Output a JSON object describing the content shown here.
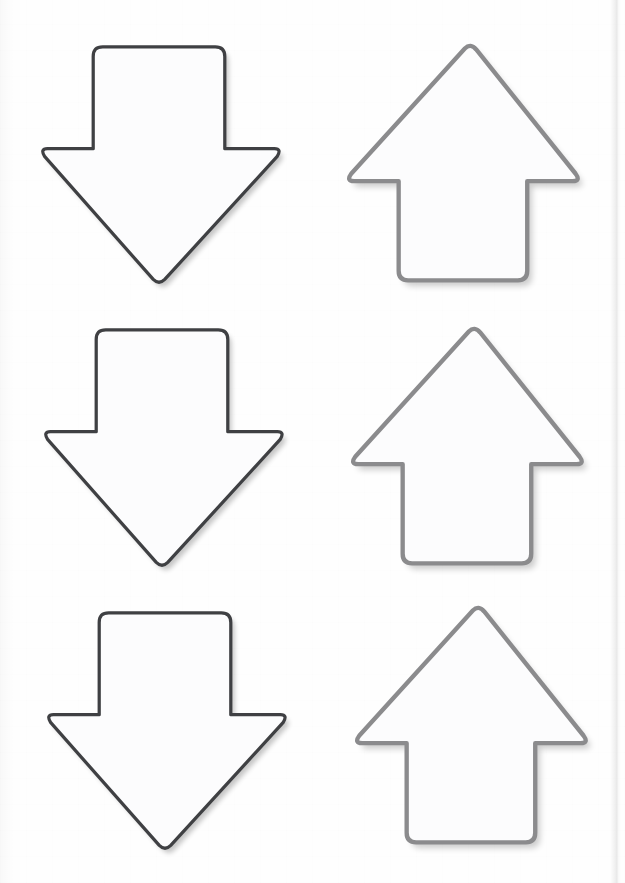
{
  "page": {
    "width": 625,
    "height": 883,
    "background_color": "#fefefe",
    "edge_line_x": 614,
    "edge_line_label": "page-edge"
  },
  "palette": {
    "paper": "#fefefe",
    "shape_fill": "#fcfcfd",
    "down_arrow_stroke": "#3f4043",
    "up_arrow_stroke": "#8b8b8d",
    "shadow": "rgba(0,0,0,0.21)"
  },
  "legend": {
    "column_left_label": "Down arrows",
    "column_right_label": "Up arrows",
    "row_labels": [
      "Row 1",
      "Row 2",
      "Row 3"
    ]
  },
  "shapes": [
    {
      "id": "arrow-down-1",
      "icon_name": "arrow-down-icon",
      "direction": "down",
      "row": 1,
      "column": 1,
      "stroke_color": "#3f4043",
      "fill_color": "#fcfcfd",
      "x": 36,
      "y": 41,
      "width": 246,
      "height": 250,
      "corner_radius": 11
    },
    {
      "id": "arrow-up-1",
      "icon_name": "arrow-up-icon",
      "direction": "up",
      "row": 1,
      "column": 2,
      "stroke_color": "#8b8b8d",
      "fill_color": "#fcfcfd",
      "x": 341,
      "y": 38,
      "width": 242,
      "height": 250,
      "corner_radius": 11
    },
    {
      "id": "arrow-down-2",
      "icon_name": "arrow-down-icon",
      "direction": "down",
      "row": 2,
      "column": 1,
      "stroke_color": "#3f4043",
      "fill_color": "#fcfcfd",
      "x": 39,
      "y": 324,
      "width": 246,
      "height": 250,
      "corner_radius": 11
    },
    {
      "id": "arrow-up-2",
      "icon_name": "arrow-up-icon",
      "direction": "up",
      "row": 2,
      "column": 2,
      "stroke_color": "#8b8b8d",
      "fill_color": "#fcfcfd",
      "x": 345,
      "y": 321,
      "width": 242,
      "height": 250,
      "corner_radius": 11
    },
    {
      "id": "arrow-down-3",
      "icon_name": "arrow-down-icon",
      "direction": "down",
      "row": 3,
      "column": 1,
      "stroke_color": "#3f4043",
      "fill_color": "#fcfcfd",
      "x": 42,
      "y": 607,
      "width": 246,
      "height": 250,
      "corner_radius": 11
    },
    {
      "id": "arrow-up-3",
      "icon_name": "arrow-up-icon",
      "direction": "up",
      "row": 3,
      "column": 2,
      "stroke_color": "#8b8b8d",
      "fill_color": "#fcfcfd",
      "x": 349,
      "y": 600,
      "width": 242,
      "height": 250,
      "corner_radius": 11
    }
  ],
  "geometry": {
    "down_arrow_path": "M 64 2 L 182 2 Q 192 2 192 12 L 192 108 L 244 108 Q 252 108 247 116 L 129 244 Q 123 250 117 244 L 3 116 Q -2 108 6 108 L 54 108 L 54 12 Q 54 2 64 2 Z",
    "up_arrow_path": "M 123 3 Q 129 -3 135 4 L 240 134 Q 246 142 237 142 L 189 142 L 189 236 Q 189 246 179 246 L 63 246 Q 53 246 53 236 L 53 142 L 6 142 Q -3 142 3 134 Z",
    "down_viewbox": "-6 -4 258 260",
    "up_viewbox": "-8 -8 256 262"
  }
}
